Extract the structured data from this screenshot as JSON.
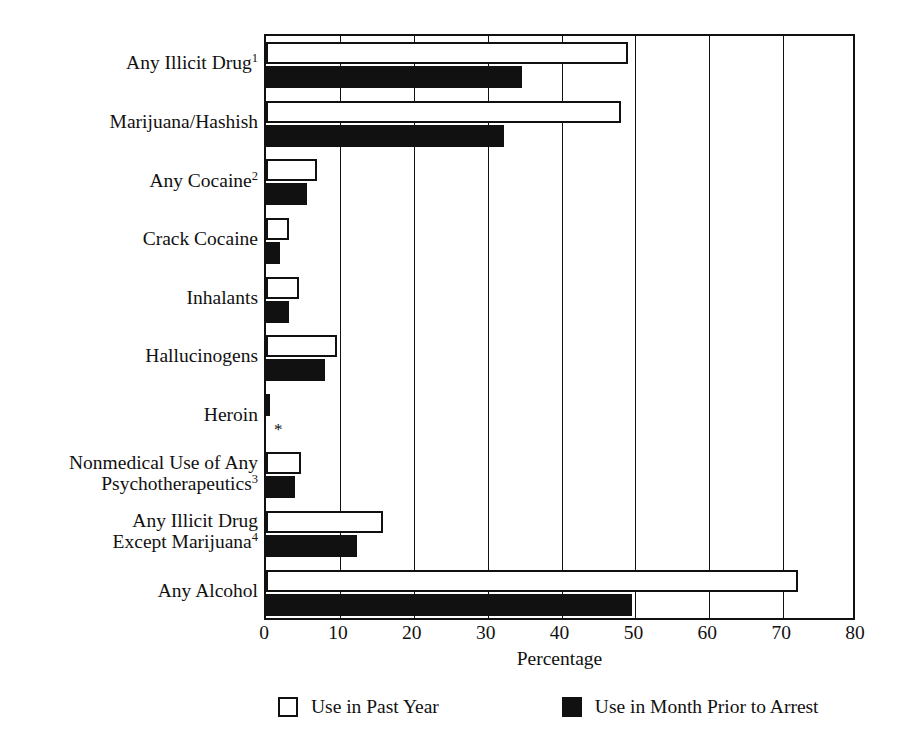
{
  "chart_data": {
    "type": "bar",
    "orientation": "horizontal",
    "title": "",
    "xlabel": "Percentage",
    "ylabel": "",
    "xlim": [
      0,
      80
    ],
    "xticks": [
      0,
      10,
      20,
      30,
      40,
      50,
      60,
      70,
      80
    ],
    "grid": true,
    "grid_axis": "x",
    "legend_position": "bottom",
    "categories": [
      "Any Illicit Drug",
      "Marijuana/Hashish",
      "Any Cocaine",
      "Crack Cocaine",
      "Inhalants",
      "Hallucinogens",
      "Heroin",
      "Nonmedical Use of Any Psychotherapeutics",
      "Any Illicit Drug Except Marijuana",
      "Any Alcohol"
    ],
    "category_labels": [
      {
        "line1": "Any Illicit Drug",
        "line2": "",
        "footnote": "1"
      },
      {
        "line1": "Marijuana/Hashish",
        "line2": "",
        "footnote": ""
      },
      {
        "line1": "Any Cocaine",
        "line2": "",
        "footnote": "2"
      },
      {
        "line1": "Crack Cocaine",
        "line2": "",
        "footnote": ""
      },
      {
        "line1": "Inhalants",
        "line2": "",
        "footnote": ""
      },
      {
        "line1": "Hallucinogens",
        "line2": "",
        "footnote": ""
      },
      {
        "line1": "Heroin",
        "line2": "",
        "footnote": ""
      },
      {
        "line1": "Nonmedical Use of Any",
        "line2": "Psychotherapeutics",
        "footnote": "3"
      },
      {
        "line1": "Any Illicit Drug",
        "line2": "Except Marijuana",
        "footnote": "4"
      },
      {
        "line1": "Any Alcohol",
        "line2": "",
        "footnote": ""
      }
    ],
    "series": [
      {
        "name": "Use in Past Year",
        "color": "#ffffff",
        "edge_color": "#111111",
        "values": [
          49.0,
          48.1,
          6.9,
          3.1,
          4.4,
          9.6,
          0.5,
          4.8,
          15.8,
          72.0
        ]
      },
      {
        "name": "Use in Month Prior to Arrest",
        "color": "#111111",
        "edge_color": "#111111",
        "values": [
          34.6,
          32.2,
          5.5,
          1.9,
          3.1,
          8.0,
          null,
          3.9,
          12.3,
          49.5
        ]
      }
    ],
    "annotations": [
      {
        "category": "Heroin",
        "series": "Use in Month Prior to Arrest",
        "text": "*",
        "meaning": "suppressed/low-precision estimate"
      }
    ]
  },
  "legend": {
    "items": [
      {
        "label": "Use in Past Year",
        "swatch": "hollow"
      },
      {
        "label": "Use in Month Prior to Arrest",
        "swatch": "filled"
      }
    ]
  },
  "axis": {
    "x_title": "Percentage",
    "x_tick_labels": [
      "0",
      "10",
      "20",
      "30",
      "40",
      "50",
      "60",
      "70",
      "80"
    ]
  },
  "colors": {
    "ink": "#111111",
    "background": "#ffffff",
    "fill_past_year": "#ffffff",
    "fill_month_prior": "#111111"
  }
}
